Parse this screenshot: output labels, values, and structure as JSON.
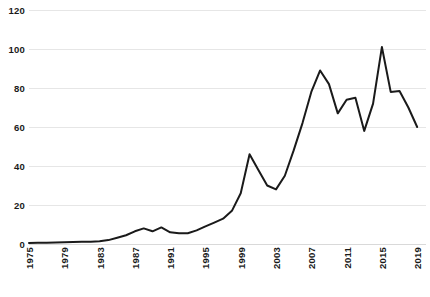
{
  "chart_data": {
    "type": "line",
    "title": "",
    "subtitle": "",
    "xlabel": "",
    "ylabel": "",
    "xlim": [
      1975,
      2020
    ],
    "ylim": [
      0,
      120
    ],
    "grid": true,
    "legend": false,
    "y_ticks": [
      0,
      20,
      40,
      60,
      80,
      100,
      120
    ],
    "y_tick_labels": [
      "0",
      "20",
      "40",
      "60",
      "80",
      "100",
      "120"
    ],
    "x_ticks": [
      1975,
      1979,
      1983,
      1987,
      1991,
      1995,
      1999,
      2003,
      2007,
      2011,
      2015,
      2019
    ],
    "x_tick_labels": [
      "1975",
      "1979",
      "1983",
      "1987",
      "1991",
      "1995",
      "1999",
      "2003",
      "2007",
      "2011",
      "2015",
      "2019"
    ],
    "line_color": "#1a1a1a",
    "line_width": 2,
    "grid_color": "#e6e6e6",
    "series": [
      {
        "name": "series-1",
        "x": [
          1975,
          1976,
          1977,
          1978,
          1979,
          1980,
          1981,
          1982,
          1983,
          1984,
          1985,
          1986,
          1987,
          1988,
          1989,
          1990,
          1991,
          1992,
          1993,
          1994,
          1995,
          1996,
          1997,
          1998,
          1999,
          2000,
          2001,
          2002,
          2003,
          2004,
          2005,
          2006,
          2007,
          2008,
          2009,
          2010,
          2011,
          2012,
          2013,
          2014,
          2015,
          2016,
          2017,
          2018,
          2019
        ],
        "values": [
          0.5,
          0.6,
          0.7,
          0.8,
          0.9,
          1.0,
          1.1,
          1.2,
          1.4,
          2.0,
          3.2,
          4.5,
          6.5,
          8.0,
          6.5,
          8.5,
          6.0,
          5.5,
          5.5,
          7.0,
          9.0,
          11.0,
          13.0,
          17.0,
          26.0,
          46.0,
          38.0,
          30.0,
          28.0,
          35.0,
          48.0,
          62.0,
          78.0,
          89.0,
          82.0,
          67.0,
          74.0,
          75.0,
          58.0,
          72.0,
          101.0,
          78.0,
          78.5,
          70.0,
          60.0
        ]
      }
    ]
  }
}
